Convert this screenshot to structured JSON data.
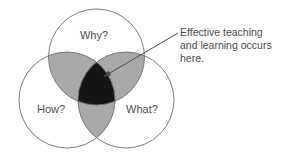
{
  "diagram": {
    "type": "venn",
    "background_color": "#ffffff",
    "outline_color": "#6e6e6e",
    "pair_overlap_color": "#a9a9a9",
    "triple_overlap_color": "#151515",
    "label_color": "#4d4d4d",
    "annotation_color": "#4a4a4a",
    "circles": [
      {
        "id": "why",
        "label": "Why?",
        "cx": 96.5,
        "cy": 57,
        "r": 48,
        "label_x": 94,
        "label_y": 36
      },
      {
        "id": "how",
        "label": "How?",
        "cx": 67,
        "cy": 100,
        "r": 48,
        "label_x": 51,
        "label_y": 110
      },
      {
        "id": "what",
        "label": "What?",
        "cx": 126,
        "cy": 100,
        "r": 48,
        "label_x": 142,
        "label_y": 110
      }
    ],
    "annotation": {
      "lines": [
        "Effective teaching",
        "and learning occurs",
        "here."
      ],
      "text_x": 180,
      "text_start_y": 33,
      "line_height": 13,
      "arrow_tail_x": 178,
      "arrow_tail_y": 33,
      "arrow_tip_x": 103,
      "arrow_tip_y": 77
    }
  }
}
